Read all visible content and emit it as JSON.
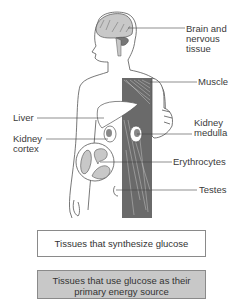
{
  "labels": {
    "brain": "Brain and",
    "brain2": "nervous",
    "brain3": "tissue",
    "muscle": "Muscle",
    "liver": "Liver",
    "kidney_cortex1": "Kidney",
    "kidney_cortex2": "cortex",
    "kidney_medulla1": "Kidney",
    "kidney_medulla2": "medulla",
    "erythrocytes": "Erythrocytes",
    "testes": "Testes"
  },
  "legend": {
    "synthesize": "Tissues that synthesize glucose",
    "use_line1": "Tissues that use glucose as their",
    "use_line2": "primary energy source"
  },
  "colors": {
    "synthesize_fill": "#ffffff",
    "use_fill": "#c8c8c8",
    "outline": "#555555"
  }
}
